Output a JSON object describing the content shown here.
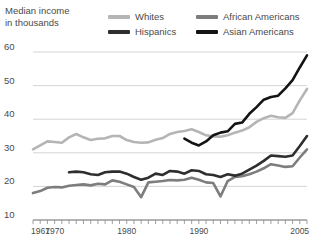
{
  "axis_title": "Median income\nin thousands",
  "legend": [
    {
      "label": "Whites",
      "color": "#b5b5b5",
      "key": "whites"
    },
    {
      "label": "African Americans",
      "color": "#7d7d7d",
      "key": "african_americans"
    },
    {
      "label": "Hispanics",
      "color": "#2e2e2e",
      "key": "hispanics"
    },
    {
      "label": "Asian Americans",
      "color": "#141414",
      "key": "asian_americans"
    }
  ],
  "chart_data": {
    "type": "line",
    "title": "Median income in thousands",
    "xlabel": "",
    "ylabel": "Median income in thousands",
    "xlim": [
      1967,
      2005
    ],
    "ylim": [
      10,
      60
    ],
    "yticks": [
      10,
      20,
      30,
      40,
      50,
      60
    ],
    "ytick_labels": [
      "10",
      "20",
      "30",
      "40",
      "50",
      "60"
    ],
    "xticks": [
      1967,
      1968,
      1969,
      1970,
      1971,
      1972,
      1973,
      1974,
      1975,
      1976,
      1977,
      1978,
      1979,
      1980,
      1981,
      1982,
      1983,
      1984,
      1985,
      1986,
      1987,
      1988,
      1989,
      1990,
      1991,
      1992,
      1993,
      1994,
      1995,
      1996,
      1997,
      1998,
      1999,
      2000,
      2001,
      2002,
      2003,
      2004,
      2005
    ],
    "xtick_labels": [
      {
        "year": 1967,
        "label": "1967"
      },
      {
        "year": 1970,
        "label": "1970"
      },
      {
        "year": 1980,
        "label": "1980"
      },
      {
        "year": 1990,
        "label": "1990"
      },
      {
        "year": 2005,
        "label": "2005"
      }
    ],
    "grid": "horizontal",
    "legend_position": "top",
    "series": [
      {
        "name": "Whites",
        "color": "#b5b5b5",
        "x": [
          1967,
          1968,
          1969,
          1970,
          1971,
          1972,
          1973,
          1974,
          1975,
          1976,
          1977,
          1978,
          1979,
          1980,
          1981,
          1982,
          1983,
          1984,
          1985,
          1986,
          1987,
          1988,
          1989,
          1990,
          1991,
          1992,
          1993,
          1994,
          1995,
          1996,
          1997,
          1998,
          1999,
          2000,
          2001,
          2002,
          2003,
          2004,
          2005
        ],
        "values": [
          31.0,
          32.2,
          33.4,
          33.2,
          33.0,
          34.6,
          35.6,
          34.6,
          33.8,
          34.2,
          34.3,
          35.0,
          35.0,
          33.8,
          33.2,
          33.0,
          33.1,
          33.9,
          34.4,
          35.6,
          36.2,
          36.5,
          37.0,
          36.2,
          35.2,
          34.9,
          34.8,
          35.2,
          36.0,
          36.6,
          37.6,
          39.2,
          40.3,
          41.0,
          40.6,
          40.4,
          41.8,
          45.6,
          49.0
        ]
      },
      {
        "name": "African Americans",
        "color": "#7d7d7d",
        "x": [
          1967,
          1968,
          1969,
          1970,
          1971,
          1972,
          1973,
          1974,
          1975,
          1976,
          1977,
          1978,
          1979,
          1980,
          1981,
          1982,
          1983,
          1984,
          1985,
          1986,
          1987,
          1988,
          1989,
          1990,
          1991,
          1992,
          1993,
          1994,
          1995,
          1996,
          1997,
          1998,
          1999,
          2000,
          2001,
          2002,
          2003,
          2004,
          2005
        ],
        "values": [
          18.0,
          18.6,
          19.6,
          19.8,
          19.7,
          20.2,
          20.4,
          20.6,
          20.3,
          20.8,
          20.6,
          21.8,
          21.4,
          20.6,
          19.8,
          16.8,
          21.2,
          21.4,
          21.6,
          21.9,
          21.8,
          22.0,
          22.6,
          22.0,
          21.2,
          21.0,
          17.0,
          21.6,
          22.8,
          23.0,
          23.6,
          24.4,
          25.4,
          26.6,
          26.2,
          25.8,
          26.0,
          28.6,
          31.0
        ]
      },
      {
        "name": "Hispanics",
        "color": "#2e2e2e",
        "x": [
          1972,
          1973,
          1974,
          1975,
          1976,
          1977,
          1978,
          1979,
          1980,
          1981,
          1982,
          1983,
          1984,
          1985,
          1986,
          1987,
          1988,
          1989,
          1990,
          1991,
          1992,
          1993,
          1994,
          1995,
          1996,
          1997,
          1998,
          1999,
          2000,
          2001,
          2002,
          2003,
          2004,
          2005
        ],
        "values": [
          24.2,
          24.4,
          24.2,
          23.6,
          23.4,
          24.2,
          24.4,
          24.4,
          23.8,
          22.8,
          22.0,
          22.6,
          23.8,
          23.4,
          24.6,
          24.4,
          23.8,
          24.8,
          24.6,
          23.6,
          23.4,
          22.8,
          23.6,
          23.2,
          23.8,
          25.0,
          26.2,
          27.6,
          29.2,
          29.0,
          28.8,
          29.2,
          32.0,
          35.0
        ]
      },
      {
        "name": "Asian Americans",
        "color": "#141414",
        "x": [
          1988,
          1989,
          1990,
          1991,
          1992,
          1993,
          1994,
          1995,
          1996,
          1997,
          1998,
          1999,
          2000,
          2001,
          2002,
          2003,
          2004,
          2005
        ],
        "values": [
          34.2,
          33.0,
          32.2,
          33.4,
          35.2,
          36.0,
          36.4,
          38.6,
          39.0,
          41.6,
          43.6,
          45.8,
          46.6,
          47.0,
          49.2,
          51.6,
          55.4,
          59.0
        ]
      }
    ]
  }
}
